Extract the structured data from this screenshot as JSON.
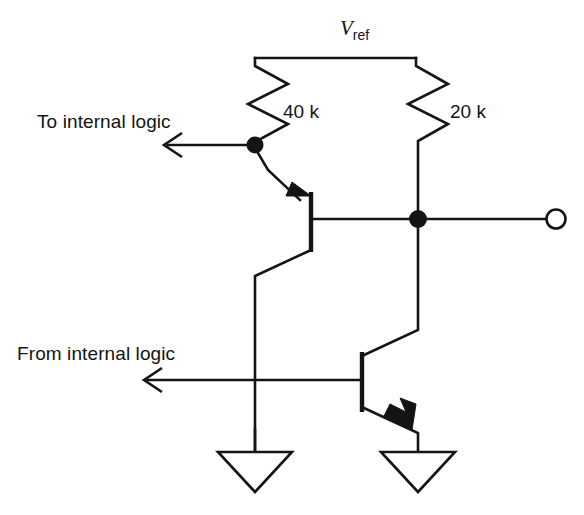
{
  "figure": {
    "background_color": "#ffffff",
    "ink_color": "#141414"
  },
  "labels": {
    "supply": {
      "symbol": "V",
      "subscript": "ref",
      "name": "Vref"
    },
    "resistor_left": "40 k",
    "resistor_right": "20 k",
    "to_internal_logic": "To internal logic",
    "from_internal_logic": "From internal logic"
  },
  "components": [
    {
      "id": "r-40k",
      "type": "resistor",
      "value": "40 k",
      "label": "40 k"
    },
    {
      "id": "r-20k",
      "type": "resistor",
      "value": "20 k",
      "label": "20 k"
    },
    {
      "id": "q-upper",
      "type": "npn-transistor",
      "role": "upper-output-transistor"
    },
    {
      "id": "q-lower",
      "type": "npn-transistor",
      "role": "lower-drive-transistor"
    },
    {
      "id": "gnd-left",
      "type": "ground"
    },
    {
      "id": "gnd-right",
      "type": "ground"
    },
    {
      "id": "out-terminal",
      "type": "open-terminal"
    },
    {
      "id": "node-base-upper",
      "type": "junction-dot"
    },
    {
      "id": "node-output",
      "type": "junction-dot"
    }
  ],
  "signals": {
    "to_internal_logic_direction": "left",
    "from_internal_logic_direction": "left"
  }
}
